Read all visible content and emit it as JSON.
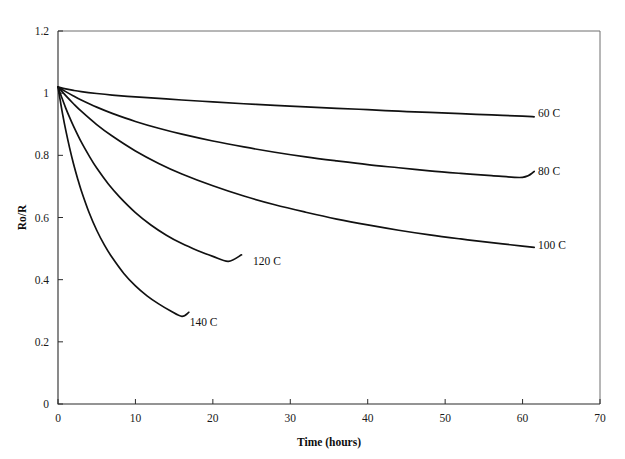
{
  "figure": {
    "width": 625,
    "height": 459,
    "background": "#ffffff",
    "ink_color": "#111111",
    "frame_color": "#6e6e6e",
    "partial_top_text": ""
  },
  "chart_data": {
    "type": "line",
    "title": "",
    "xlabel": "Time (hours)",
    "ylabel": "Ro/R",
    "xlim": [
      0,
      70
    ],
    "ylim": [
      0,
      1.2
    ],
    "xticks": [
      0,
      10,
      20,
      30,
      40,
      50,
      60,
      70
    ],
    "xticklabels": [
      "0",
      "10",
      "20",
      "30",
      "40",
      "50",
      "60",
      "70"
    ],
    "yticks": [
      0,
      0.2,
      0.4,
      0.6,
      0.8,
      1,
      1.2
    ],
    "yticklabels": [
      "0",
      "0.2",
      "0.4",
      "0.6",
      "0.8",
      "1",
      "1.2"
    ],
    "grid": false,
    "legend_position": "inline-end-of-curve",
    "series": [
      {
        "name": "60 C",
        "label": "60 C",
        "label_x": 62.0,
        "label_y": 0.935,
        "x": [
          0,
          1,
          2,
          3,
          5,
          7,
          10,
          13,
          16,
          20,
          24,
          28,
          32,
          36,
          40,
          44,
          48,
          52,
          56,
          60,
          61.5
        ],
        "y": [
          1.02,
          1.014,
          1.009,
          1.005,
          0.999,
          0.994,
          0.988,
          0.983,
          0.978,
          0.972,
          0.966,
          0.961,
          0.956,
          0.951,
          0.947,
          0.942,
          0.938,
          0.934,
          0.93,
          0.926,
          0.924
        ]
      },
      {
        "name": "80 C",
        "label": "80 C",
        "label_x": 62.0,
        "label_y": 0.748,
        "x": [
          0,
          1,
          2,
          3,
          5,
          7,
          10,
          13,
          16,
          20,
          24,
          28,
          32,
          36,
          40,
          44,
          48,
          52,
          56,
          60,
          61.5
        ],
        "y": [
          1.02,
          1.005,
          0.991,
          0.978,
          0.955,
          0.935,
          0.909,
          0.887,
          0.868,
          0.846,
          0.827,
          0.81,
          0.795,
          0.782,
          0.77,
          0.76,
          0.75,
          0.742,
          0.735,
          0.729,
          0.748
        ]
      },
      {
        "name": "100 C",
        "label": "100 C",
        "label_x": 62.0,
        "label_y": 0.51,
        "x": [
          0,
          1,
          2,
          3,
          5,
          7,
          10,
          13,
          16,
          20,
          24,
          28,
          32,
          36,
          40,
          44,
          48,
          52,
          56,
          60,
          61.5
        ],
        "y": [
          1.02,
          0.992,
          0.966,
          0.942,
          0.899,
          0.862,
          0.814,
          0.774,
          0.74,
          0.702,
          0.669,
          0.641,
          0.617,
          0.595,
          0.576,
          0.559,
          0.544,
          0.531,
          0.519,
          0.508,
          0.504
        ]
      },
      {
        "name": "120 C",
        "label": "120 C",
        "label_x": 25.2,
        "label_y": 0.46,
        "x": [
          0,
          0.5,
          1,
          1.5,
          2,
          3,
          4,
          5,
          6.5,
          8,
          10,
          12,
          14,
          16,
          18,
          20,
          22,
          23.7
        ],
        "y": [
          1.02,
          0.985,
          0.952,
          0.922,
          0.894,
          0.843,
          0.799,
          0.759,
          0.708,
          0.665,
          0.616,
          0.576,
          0.543,
          0.516,
          0.494,
          0.475,
          0.459,
          0.48
        ]
      },
      {
        "name": "140 C",
        "label": "140 C",
        "label_x": 17.0,
        "label_y": 0.265,
        "x": [
          0,
          0.3,
          0.6,
          1,
          1.5,
          2,
          2.5,
          3,
          4,
          5,
          6,
          7,
          8.5,
          10,
          11.5,
          13,
          14.5,
          16,
          16.9
        ],
        "y": [
          1.02,
          0.975,
          0.932,
          0.881,
          0.824,
          0.773,
          0.728,
          0.687,
          0.617,
          0.559,
          0.511,
          0.471,
          0.42,
          0.38,
          0.348,
          0.322,
          0.3,
          0.282,
          0.295
        ]
      }
    ]
  }
}
